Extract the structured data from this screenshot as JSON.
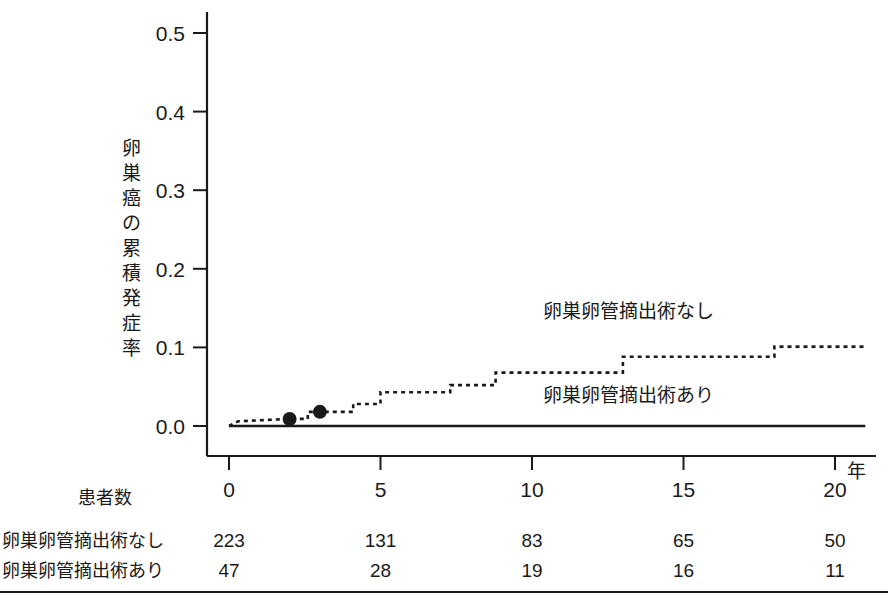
{
  "chart_data": {
    "type": "line",
    "title": "",
    "xlabel": "年",
    "ylabel": "卵巣癌の累積発症率",
    "xlim": [
      0,
      21
    ],
    "ylim": [
      0.0,
      0.53
    ],
    "grid": false,
    "legend_position": "inline-right",
    "xticks": [
      0,
      5,
      10,
      15,
      20
    ],
    "xtick_labels": [
      "0",
      "5",
      "10",
      "15",
      "20"
    ],
    "x_unit_label": "年",
    "yticks": [
      0.0,
      0.1,
      0.2,
      0.3,
      0.4,
      0.5
    ],
    "ytick_labels": [
      "0.0",
      "0.1",
      "0.2",
      "0.3",
      "0.4",
      "0.5"
    ],
    "series": [
      {
        "name": "卵巣卵管摘出術なし",
        "style": "dotted",
        "inline_label": "卵巣卵管摘出術なし",
        "inline_label_x": 13.2,
        "inline_label_y": 0.137,
        "step_points": [
          [
            0.0,
            0.0
          ],
          [
            0.3,
            0.006
          ],
          [
            2.0,
            0.009
          ],
          [
            2.6,
            0.009
          ],
          [
            2.6,
            0.018
          ],
          [
            4.1,
            0.018
          ],
          [
            4.1,
            0.028
          ],
          [
            5.0,
            0.028
          ],
          [
            5.0,
            0.043
          ],
          [
            7.3,
            0.043
          ],
          [
            7.3,
            0.052
          ],
          [
            8.8,
            0.052
          ],
          [
            8.8,
            0.068
          ],
          [
            13.0,
            0.068
          ],
          [
            13.0,
            0.088
          ],
          [
            18.0,
            0.088
          ],
          [
            18.0,
            0.101
          ],
          [
            21.0,
            0.101
          ]
        ],
        "censor_marks": [
          [
            2.0,
            0.009
          ],
          [
            3.0,
            0.018
          ]
        ]
      },
      {
        "name": "卵巣卵管摘出術あり",
        "style": "solid",
        "inline_label": "卵巣卵管摘出術あり",
        "inline_label_x": 13.2,
        "inline_label_y": 0.03,
        "step_points": [
          [
            0.0,
            0.0
          ],
          [
            21.0,
            0.0
          ]
        ],
        "censor_marks": []
      }
    ],
    "risk_table": {
      "header": "患者数",
      "times": [
        0,
        5,
        10,
        15,
        20
      ],
      "rows": [
        {
          "label": "卵巣卵管摘出術なし",
          "values": [
            "223",
            "131",
            "83",
            "65",
            "50"
          ]
        },
        {
          "label": "卵巣卵管摘出術あり",
          "values": [
            "47",
            "28",
            "19",
            "16",
            "11"
          ]
        }
      ]
    },
    "colors": {
      "ink": "#1a1a1a",
      "background": "#ffffff"
    }
  }
}
